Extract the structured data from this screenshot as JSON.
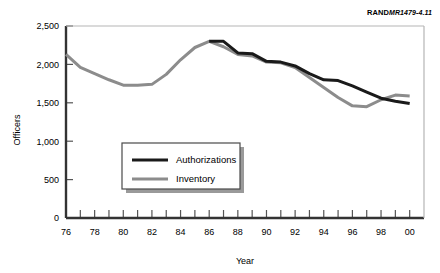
{
  "credit": {
    "brand": "RAND",
    "document_id": "MR1479-4.11"
  },
  "chart_data": {
    "type": "line",
    "title": "",
    "xlabel": "Year",
    "ylabel": "Officers",
    "xlim": [
      76,
      101
    ],
    "ylim": [
      0,
      2500
    ],
    "yticks": [
      0,
      500,
      1000,
      1500,
      2000,
      2500
    ],
    "ytick_labels": [
      "0",
      "500",
      "1,000",
      "1,500",
      "2,000",
      "2,500"
    ],
    "xticks": [
      76,
      77,
      78,
      79,
      80,
      81,
      82,
      83,
      84,
      85,
      86,
      87,
      88,
      89,
      90,
      91,
      92,
      93,
      94,
      95,
      96,
      97,
      98,
      99,
      100
    ],
    "xtick_labels": [
      "76",
      "",
      "78",
      "",
      "80",
      "",
      "82",
      "",
      "84",
      "",
      "86",
      "",
      "88",
      "",
      "90",
      "",
      "92",
      "",
      "94",
      "",
      "96",
      "",
      "98",
      "",
      "00"
    ],
    "grid": false,
    "legend_position": "center-left",
    "series": [
      {
        "name": "Authorizations",
        "color": "#1a1a1a",
        "x": [
          86,
          87,
          88,
          89,
          90,
          91,
          92,
          93,
          94,
          95,
          96,
          97,
          98,
          99,
          100
        ],
        "values": [
          2300,
          2300,
          2150,
          2140,
          2040,
          2030,
          1980,
          1880,
          1800,
          1790,
          1720,
          1640,
          1560,
          1520,
          1490
        ]
      },
      {
        "name": "Inventory",
        "color": "#8c8c8c",
        "x": [
          76,
          77,
          78,
          79,
          80,
          81,
          82,
          83,
          84,
          85,
          86,
          87,
          88,
          89,
          90,
          91,
          92,
          93,
          94,
          95,
          96,
          97,
          98,
          99,
          100
        ],
        "values": [
          2130,
          1960,
          1880,
          1800,
          1730,
          1730,
          1740,
          1870,
          2060,
          2220,
          2300,
          2230,
          2130,
          2110,
          2030,
          2020,
          1960,
          1830,
          1700,
          1570,
          1460,
          1450,
          1540,
          1600,
          1590
        ]
      }
    ]
  },
  "legend": {
    "items": [
      {
        "label": "Authorizations",
        "color": "#1a1a1a"
      },
      {
        "label": "Inventory",
        "color": "#8c8c8c"
      }
    ]
  }
}
